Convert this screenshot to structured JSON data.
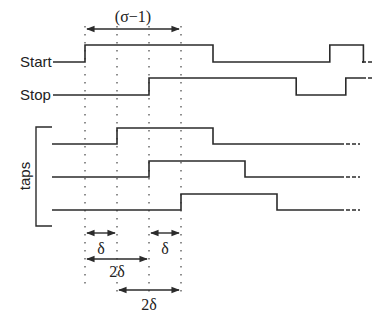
{
  "diagram": {
    "time_marks": [
      "t0",
      "t0+δ",
      "t0+2δ",
      "t0+3δ"
    ],
    "top_span": {
      "label": "(σ−1)",
      "from": 0,
      "to": 3
    },
    "signals": [
      {
        "id": "start",
        "label": "Start",
        "edges": [
          0,
          4,
          7.65,
          8.7
        ],
        "initial": "low",
        "continues": true
      },
      {
        "id": "stop",
        "label": "Stop",
        "edges": [
          2,
          6.6,
          8.15
        ],
        "initial": "low",
        "continues": true
      }
    ],
    "taps": {
      "label": "taps",
      "lines": [
        {
          "id": "tap-1",
          "edges": [
            1,
            4
          ],
          "initial": "low",
          "continues": true
        },
        {
          "id": "tap-2",
          "edges": [
            2,
            5
          ],
          "initial": "low",
          "continues": true
        },
        {
          "id": "tap-3",
          "edges": [
            3,
            6
          ],
          "initial": "low",
          "continues": true
        }
      ]
    },
    "intervals": [
      {
        "label": "δ",
        "from": 0,
        "to": 1,
        "row": 1
      },
      {
        "label": "δ",
        "from": 2,
        "to": 3,
        "row": 1
      },
      {
        "label": "2δ",
        "from": 0,
        "to": 2,
        "row": 2
      },
      {
        "label": "2δ",
        "from": 1,
        "to": 3,
        "row": 3
      }
    ]
  }
}
